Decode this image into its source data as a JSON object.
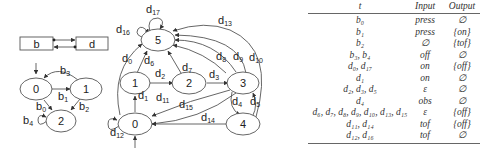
{
  "block_diagram": {
    "left_block": "b",
    "right_block": "d"
  },
  "automaton_b": {
    "states": [
      "0",
      "1",
      "2"
    ],
    "transitions": [
      {
        "label": "b",
        "sub": "0",
        "from": "0",
        "to": "2"
      },
      {
        "label": "b",
        "sub": "1",
        "from": "0",
        "to": "1"
      },
      {
        "label": "b",
        "sub": "2",
        "from": "1",
        "to": "2"
      },
      {
        "label": "b",
        "sub": "3",
        "from": "1",
        "to": "0"
      },
      {
        "label": "b",
        "sub": "4",
        "from": "2",
        "to": "2"
      }
    ]
  },
  "automaton_d": {
    "states": [
      "0",
      "1",
      "2",
      "3",
      "4",
      "5"
    ],
    "transitions": [
      {
        "label": "d",
        "sub": "0",
        "from": "0",
        "to": "5"
      },
      {
        "label": "d",
        "sub": "1",
        "from": "0",
        "to": "1"
      },
      {
        "label": "d",
        "sub": "2",
        "from": "1",
        "to": "2"
      },
      {
        "label": "d",
        "sub": "3",
        "from": "2",
        "to": "3"
      },
      {
        "label": "d",
        "sub": "4",
        "from": "3",
        "to": "4"
      },
      {
        "label": "d",
        "sub": "5",
        "from": "4",
        "to": "3"
      },
      {
        "label": "d",
        "sub": "6",
        "from": "1",
        "to": "5"
      },
      {
        "label": "d",
        "sub": "7",
        "from": "2",
        "to": "5"
      },
      {
        "label": "d",
        "sub": "8",
        "from": "3",
        "to": "5"
      },
      {
        "label": "d",
        "sub": "9",
        "from": "3",
        "to": "5"
      },
      {
        "label": "d",
        "sub": "10",
        "from": "3",
        "to": "5"
      },
      {
        "label": "d",
        "sub": "11",
        "from": "3",
        "to": "0"
      },
      {
        "label": "d",
        "sub": "12",
        "from": "0",
        "to": "0"
      },
      {
        "label": "d",
        "sub": "13",
        "from": "4",
        "to": "5"
      },
      {
        "label": "d",
        "sub": "14",
        "from": "4",
        "to": "0"
      },
      {
        "label": "d",
        "sub": "15",
        "from": "3",
        "to": "0"
      },
      {
        "label": "d",
        "sub": "16",
        "from": "5",
        "to": "5"
      },
      {
        "label": "d",
        "sub": "17",
        "from": "5",
        "to": "5"
      }
    ]
  },
  "table": {
    "headers": {
      "t": "t",
      "input": "Input",
      "output": "Output"
    },
    "rows": [
      {
        "t": "b₀",
        "input": "press",
        "output": "∅"
      },
      {
        "t": "b₁",
        "input": "press",
        "output": "{on}"
      },
      {
        "t": "b₂",
        "input": "∅",
        "output": "{tof}"
      },
      {
        "t": "b₃, b₄",
        "input": "off",
        "output": "∅"
      },
      {
        "t": "d₀, d₁₇",
        "input": "on",
        "output": "{off}"
      },
      {
        "t": "d₁",
        "input": "on",
        "output": "∅"
      },
      {
        "t": "d₂, d₃, d₅",
        "input": "ε",
        "output": "∅"
      },
      {
        "t": "d₄",
        "input": "obs",
        "output": "∅"
      },
      {
        "t": "d₆, d₇, d₈, d₉, d₁₀, d₁₃, d₁₅",
        "input": "ε",
        "output": "{off}"
      },
      {
        "t": "d₁₁, d₁₄",
        "input": "tof",
        "output": "{off}"
      },
      {
        "t": "d₁₂, d₁₆",
        "input": "tof",
        "output": "∅"
      }
    ]
  }
}
